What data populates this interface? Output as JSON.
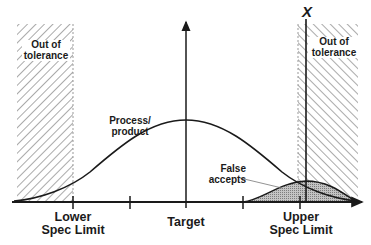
{
  "diagram": {
    "type": "specification-limits-distribution",
    "regions": {
      "left_out_of_tolerance": {
        "label_line1": "Out of",
        "label_line2": "tolerance"
      },
      "right_out_of_tolerance": {
        "label_line1": "Out of",
        "label_line2": "tolerance"
      }
    },
    "axis_labels": {
      "lower_spec_line1": "Lower",
      "lower_spec_line2": "Spec Limit",
      "target": "Target",
      "upper_spec_line1": "Upper",
      "upper_spec_line2": "Spec Limit"
    },
    "curves": {
      "process_label_line1": "Process/",
      "process_label_line2": "product",
      "false_accepts_line1": "False",
      "false_accepts_line2": "accepts"
    },
    "marker": {
      "label": "X"
    },
    "colors": {
      "line": "#1a1a1a",
      "hatch": "#555555",
      "fill_dotted": "#9a9a9a",
      "background": "#ffffff"
    }
  }
}
